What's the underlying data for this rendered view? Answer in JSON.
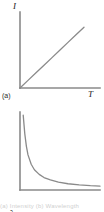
{
  "figure": {
    "background_color": "#ffffff",
    "axis_color": "#8a8a8a",
    "curve_color": "#8a8a8a",
    "text_color": "#1a1a1a",
    "caption_faint": "(a) Intensity (b) Wavelength"
  },
  "panels": [
    {
      "tag": "(a)",
      "ylabel": "I",
      "xlabel": "T",
      "description": "linear increasing line from origin"
    },
    {
      "tag": "(b)",
      "ylabel": "λ",
      "xlabel": "T",
      "description": "inverse hyperbolic decay curve"
    }
  ],
  "chart_data": [
    {
      "type": "line",
      "title": "",
      "subtitle": "",
      "panel": "(a)",
      "xlabel": "T",
      "ylabel": "I",
      "xlim": [
        0,
        100
      ],
      "ylim": [
        0,
        100
      ],
      "grid": false,
      "legend": null,
      "ticks": {
        "x": [],
        "y": []
      },
      "series": [
        {
          "name": "I vs T",
          "x": [
            0,
            10,
            20,
            30,
            40,
            50,
            60,
            70,
            80
          ],
          "values": [
            0,
            10,
            20,
            30,
            40,
            50,
            60,
            70,
            80
          ]
        }
      ],
      "annotations": [
        "(a)"
      ]
    },
    {
      "type": "line",
      "title": "",
      "subtitle": "",
      "panel": "(b)",
      "xlabel": "T",
      "ylabel": "λ",
      "xlim": [
        0,
        100
      ],
      "ylim": [
        0,
        100
      ],
      "grid": false,
      "legend": null,
      "ticks": {
        "x": [],
        "y": []
      },
      "series": [
        {
          "name": "lambda vs T",
          "x": [
            4,
            6,
            8,
            10,
            14,
            18,
            24,
            30,
            38,
            48,
            60,
            74,
            88,
            100
          ],
          "values": [
            96,
            72,
            56,
            45,
            33,
            26,
            20,
            16,
            13,
            10,
            8,
            6.5,
            5.5,
            5
          ]
        }
      ],
      "annotations": [
        "(b)"
      ]
    }
  ]
}
